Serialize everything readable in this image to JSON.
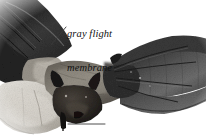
{
  "figure": {
    "rendering": "black-and-white halftone photograph",
    "background_color": "#ffffff",
    "width_px": 206,
    "height_px": 136
  },
  "callouts": [
    {
      "id": "gray-flight-membrane",
      "text": "gray flight\nmembrane",
      "line1": "gray flight",
      "line2": "membrane",
      "style": "italic serif",
      "text_color": "#111111",
      "leader": {
        "type": "diagonal",
        "x1": 66,
        "y1": 27,
        "x2": 51,
        "y2": 45,
        "color": "#3a3a3a"
      }
    },
    {
      "id": "pale-underside",
      "text": "pale underside",
      "line1": "pale underside",
      "style": "italic serif",
      "text_color": "#111111",
      "leader": {
        "type": "horizontal",
        "x1": 105,
        "y1": 124,
        "x2": 68,
        "y2": 124,
        "color": "#3a3a3a"
      }
    }
  ],
  "anatomy_parts": [
    "left wing",
    "right wing",
    "gray flight membrane",
    "pale underside",
    "head",
    "ears",
    "tail membrane",
    "foot"
  ]
}
